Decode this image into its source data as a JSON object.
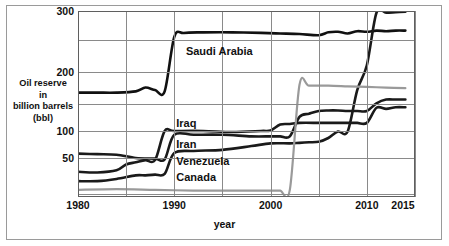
{
  "chart_data": {
    "type": "line",
    "title": "",
    "xlabel": "year",
    "ylabel": "Oil reserve in billion barrels (bbl)",
    "ylabel_lines": [
      "Oil reserve",
      "in",
      "billion barrels",
      "(bbl)"
    ],
    "xlim": [
      1980,
      2015
    ],
    "ylim": [
      0,
      300
    ],
    "yticks": [
      300,
      200,
      100,
      50
    ],
    "ytick_labels": [
      "300",
      "200",
      "100",
      "50"
    ],
    "y_gridlines": [
      300,
      250,
      200,
      150,
      100,
      50,
      0
    ],
    "xticks": [
      1980,
      1990,
      2000,
      2010,
      2015
    ],
    "xtick_labels": [
      "1980",
      "1990",
      "2000",
      "2010",
      "2015"
    ],
    "x_gridlines": [
      1985,
      1990,
      1995,
      2000,
      2005,
      2010,
      2015
    ],
    "grid": true,
    "legend": "inline-labels",
    "y_scale_note": "compressed below 100",
    "series": [
      {
        "name": "Saudi Arabia",
        "color": "#111111",
        "width": 2.6,
        "label_x": 1991,
        "label_y": 232,
        "x": [
          1980,
          1982,
          1984,
          1986,
          1987,
          1988,
          1989,
          1990,
          1991,
          1993,
          1996,
          1999,
          2001,
          2003,
          2005,
          2006,
          2007,
          2008,
          2009,
          2010,
          2011,
          2012,
          2013,
          2014
        ],
        "y": [
          168,
          168,
          168,
          170,
          176,
          172,
          170,
          255,
          262,
          263,
          263,
          262,
          261,
          260,
          258,
          263,
          264,
          261,
          265,
          264,
          266,
          265,
          266,
          266
        ]
      },
      {
        "name": "Iraq",
        "color": "#1a1a1a",
        "width": 2.6,
        "label_x": 1990,
        "label_y": 112,
        "x": [
          1980,
          1982,
          1984,
          1985,
          1986,
          1987,
          1988,
          1989,
          1990,
          1993,
          1996,
          1999,
          2000,
          2001,
          2002,
          2003,
          2005,
          2006,
          2007,
          2008,
          2009,
          2010,
          2011,
          2012,
          2013,
          2014
        ],
        "y": [
          31,
          30,
          33,
          41,
          44,
          47,
          47,
          100,
          100,
          100,
          98,
          100,
          101,
          112,
          113,
          115,
          115,
          115,
          115,
          115,
          115,
          115,
          143,
          141,
          144,
          144
        ]
      },
      {
        "name": "Iran",
        "color": "#1a1a1a",
        "width": 2.6,
        "label_x": 1990,
        "label_y": 74,
        "x": [
          1980,
          1982,
          1984,
          1986,
          1988,
          1989,
          1990,
          1992,
          1995,
          1998,
          2000,
          2001,
          2002,
          2003,
          2004,
          2005,
          2006,
          2007,
          2008,
          2009,
          2010,
          2011,
          2012,
          2013,
          2014
        ],
        "y": [
          58,
          57,
          56,
          50,
          49,
          48,
          93,
          93,
          93,
          90,
          90,
          90,
          90,
          126,
          132,
          137,
          138,
          138,
          137,
          137,
          137,
          151,
          157,
          157,
          157
        ]
      },
      {
        "name": "Venezuela",
        "color": "#1a1a1a",
        "width": 2.6,
        "label_x": 1990,
        "label_y": 44,
        "x": [
          1980,
          1982,
          1984,
          1986,
          1987,
          1988,
          1989,
          1990,
          1992,
          1995,
          1998,
          2000,
          2002,
          2003,
          2004,
          2005,
          2006,
          2007,
          2008,
          2009,
          2010,
          2011,
          2012,
          2013,
          2014
        ],
        "y": [
          18,
          18,
          21,
          26,
          26,
          27,
          28,
          59,
          63,
          65,
          72,
          77,
          77,
          78,
          79,
          80,
          87,
          99,
          99,
          172,
          211,
          297,
          297,
          298,
          299
        ]
      },
      {
        "name": "Canada",
        "color": "#9a9a9a",
        "width": 2.2,
        "label_x": 1990,
        "label_y": 23,
        "x": [
          1980,
          1984,
          1988,
          1992,
          1996,
          1999,
          2000,
          2001,
          2002,
          2003,
          2004,
          2006,
          2008,
          2010,
          2012,
          2014
        ],
        "y": [
          6,
          7,
          6,
          5,
          5,
          5,
          5,
          5,
          6,
          180,
          179,
          179,
          178,
          177,
          176,
          175
        ]
      }
    ]
  },
  "axis": {
    "y_title_line1": "Oil reserve",
    "y_title_line2": "in",
    "y_title_line3": "billion barrels",
    "y_title_line4": "(bbl)",
    "x_title": "year"
  }
}
